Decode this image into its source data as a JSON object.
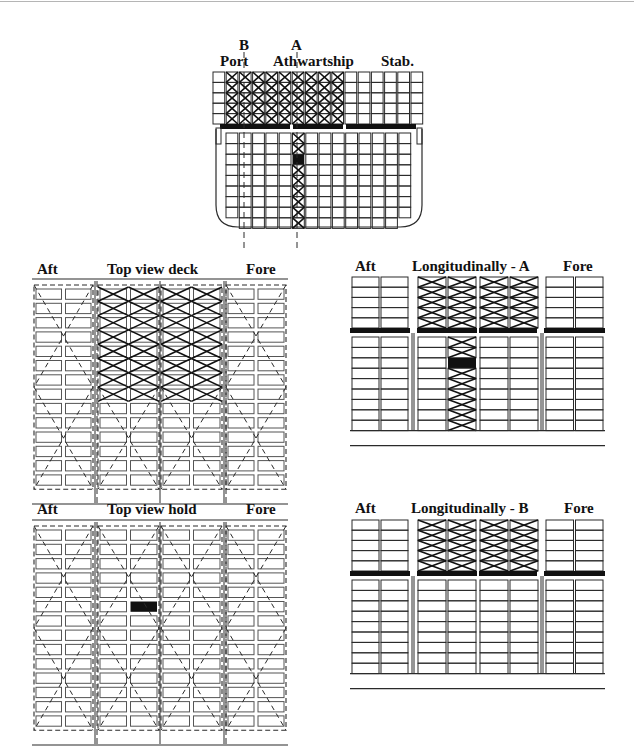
{
  "cross_section": {
    "marker_b": "B",
    "marker_a": "A",
    "label_port": "Port",
    "label_athwartship": "Athwartship",
    "label_stab": "Stab.",
    "deck_columns": 16,
    "deck_rows": 5,
    "deck_crossed_columns": [
      1,
      2,
      3,
      4,
      5,
      6,
      7,
      8,
      9
    ],
    "hold_columns": 14,
    "hold_rows": 9,
    "hold_crossed_column": 5,
    "hold_black_row": 2,
    "section_a_column": "A",
    "section_b_column": "B"
  },
  "top_view_deck": {
    "label_aft": "Aft",
    "label_title": "Top view deck",
    "label_fore": "Fore",
    "blocks": 4,
    "columns_per_block": 2,
    "rows": 14,
    "crossed_blocks": [
      1,
      2
    ],
    "crossed_rows": 8
  },
  "longitudinal_a": {
    "label_aft": "Aft",
    "label_title": "Longitudinally - A",
    "label_fore": "Fore",
    "deck_rows": 5,
    "hold_rows": 9,
    "crossed_deck_blocks": [
      1,
      2
    ],
    "hold_crossed_block": 1,
    "hold_crossed_column": 1,
    "hold_black_row": 2
  },
  "top_view_hold": {
    "label_aft": "Aft",
    "label_title": "Top view hold",
    "label_fore": "Fore",
    "blocks": 4,
    "columns_per_block": 2,
    "rows": 14,
    "black_block": 1,
    "black_column": 1,
    "black_row": 5
  },
  "longitudinal_b": {
    "label_aft": "Aft",
    "label_title": "Longitudinally - B",
    "label_fore": "Fore",
    "deck_rows": 5,
    "hold_rows": 9,
    "crossed_deck_blocks": [
      1,
      2
    ]
  },
  "colors": {
    "line": "#2a2a2a",
    "hatch": "#111111",
    "fill_black": "#111111",
    "background": "#ffffff"
  }
}
